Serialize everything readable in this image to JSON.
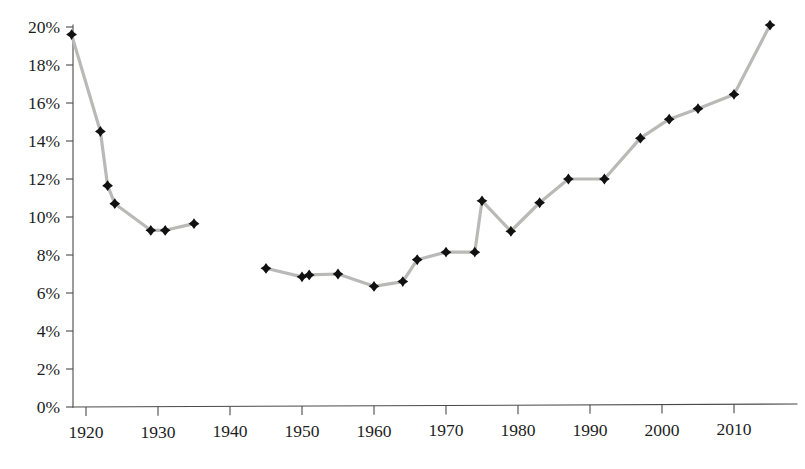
{
  "chart_data": {
    "type": "line",
    "title": "",
    "subtitle": "",
    "xlabel": "",
    "ylabel": "",
    "xlim": [
      1916,
      2017
    ],
    "ylim": [
      0,
      0.205
    ],
    "grid": false,
    "legend": false,
    "legend_position": "none",
    "y_tick_labels": [
      "0%",
      "2%",
      "4%",
      "6%",
      "8%",
      "10%",
      "12%",
      "14%",
      "16%",
      "18%",
      "20%"
    ],
    "y_tick_values": [
      0,
      2,
      4,
      6,
      8,
      10,
      12,
      14,
      16,
      18,
      20
    ],
    "x_tick_labels": [
      "1920",
      "1930",
      "1940",
      "1950",
      "1960",
      "1970",
      "1980",
      "1990",
      "2000",
      "2010"
    ],
    "x_tick_values": [
      1920,
      1930,
      1940,
      1950,
      1960,
      1970,
      1980,
      1990,
      2000,
      2010
    ],
    "series": [
      {
        "name": "share",
        "marker": "diamond",
        "marker_color": "#111111",
        "line_color": "#b9b9b7",
        "x": [
          1918,
          1922,
          1923,
          1924,
          1929,
          1931,
          1935,
          1945,
          1950,
          1951,
          1955,
          1960,
          1964,
          1966,
          1970,
          1974,
          1975,
          1979,
          1983,
          1987,
          1992,
          1997,
          2001,
          2005,
          2010,
          2015
        ],
        "values": [
          19.6,
          14.5,
          11.65,
          10.7,
          9.3,
          9.3,
          9.65,
          7.3,
          6.85,
          6.95,
          7.0,
          6.35,
          6.6,
          7.75,
          8.15,
          8.15,
          10.85,
          9.25,
          10.75,
          12.0,
          12.0,
          14.15,
          15.15,
          15.7,
          16.45,
          20.1
        ],
        "gaps": [
          [
            1935,
            1945
          ]
        ]
      }
    ],
    "colors": {
      "marker": "#111111",
      "line": "#b9b9b7",
      "axis": "#4a4a48",
      "text": "#1d1d1d",
      "background": "#ffffff"
    }
  },
  "geometry": {
    "plot_left": 73,
    "plot_right": 797,
    "plot_bottom": 407,
    "plot_top": 26,
    "year_origin": 1920,
    "year_origin_x": 86,
    "px_per_year": 7.2,
    "px_per_pct": 19.0
  }
}
